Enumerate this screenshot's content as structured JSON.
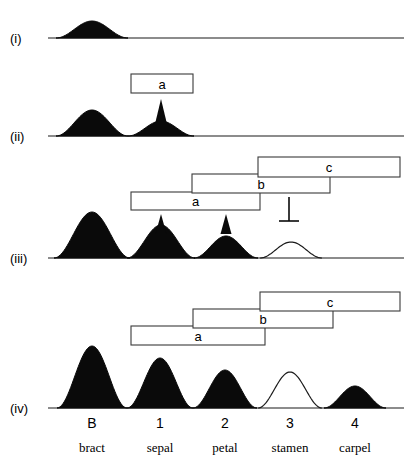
{
  "figure": {
    "width": 418,
    "height": 468,
    "background": "#ffffff",
    "ink_color": "#0a0a0a",
    "box_stroke": "#3a3a3a"
  },
  "panels": [
    {
      "id": "i",
      "label": "(i)",
      "label_x": 10,
      "label_y": 38,
      "baseline_y": 38,
      "baseline_x0": 48,
      "baseline_x1": 404,
      "boxes": [],
      "arrows": [],
      "inhibitors": [],
      "curves": [
        {
          "name": "bract-domain",
          "center": 92,
          "halfwidth": 36,
          "height": 17,
          "filled": true
        }
      ]
    },
    {
      "id": "ii",
      "label": "(ii)",
      "label_x": 10,
      "label_y": 136,
      "baseline_y": 136,
      "baseline_x0": 48,
      "baseline_x1": 404,
      "boxes": [
        {
          "label": "a",
          "x0": 131,
          "x1": 193,
          "y0": 74,
          "y1": 93
        }
      ],
      "arrows": [
        {
          "name": "arrow-a-to-sepal",
          "x": 161,
          "y_tip": 99,
          "y_base": 122
        }
      ],
      "inhibitors": [],
      "curves": [
        {
          "name": "bract-domain",
          "center": 92,
          "halfwidth": 36,
          "height": 26,
          "filled": true
        },
        {
          "name": "sepal-domain",
          "center": 161,
          "halfwidth": 33,
          "height": 15,
          "filled": true
        }
      ]
    },
    {
      "id": "iii",
      "label": "(iii)",
      "label_x": 10,
      "label_y": 258,
      "baseline_y": 258,
      "baseline_x0": 48,
      "baseline_x1": 404,
      "boxes": [
        {
          "label": "c",
          "x0": 258,
          "x1": 400,
          "y0": 157,
          "y1": 177
        },
        {
          "label": "b",
          "x0": 192,
          "x1": 330,
          "y0": 174,
          "y1": 193
        },
        {
          "label": "a",
          "x0": 131,
          "x1": 260,
          "y0": 192,
          "y1": 210
        }
      ],
      "arrows": [
        {
          "name": "arrow-a-to-sepal",
          "x": 161,
          "y_tip": 214,
          "y_base": 234
        },
        {
          "name": "arrow-a-to-petal",
          "x": 226,
          "y_tip": 214,
          "y_base": 234
        }
      ],
      "inhibitors": [
        {
          "name": "inhibit-c-on-a",
          "x": 289,
          "y_top": 197,
          "y_bottom": 221,
          "bar_halfwidth": 10
        }
      ],
      "curves": [
        {
          "name": "bract-domain",
          "center": 92,
          "halfwidth": 38,
          "height": 46,
          "filled": true
        },
        {
          "name": "sepal-domain",
          "center": 161,
          "halfwidth": 34,
          "height": 33,
          "filled": true
        },
        {
          "name": "petal-domain",
          "center": 226,
          "halfwidth": 32,
          "height": 22,
          "filled": true
        },
        {
          "name": "stamen-domain",
          "center": 291,
          "halfwidth": 31,
          "height": 16,
          "filled": false
        }
      ]
    },
    {
      "id": "iv",
      "label": "(iv)",
      "label_x": 10,
      "label_y": 408,
      "baseline_y": 408,
      "baseline_x0": 48,
      "baseline_x1": 404,
      "boxes": [
        {
          "label": "c",
          "x0": 260,
          "x1": 400,
          "y0": 292,
          "y1": 311
        },
        {
          "label": "b",
          "x0": 193,
          "x1": 333,
          "y0": 309,
          "y1": 328
        },
        {
          "label": "a",
          "x0": 131,
          "x1": 265,
          "y0": 326,
          "y1": 345
        }
      ],
      "arrows": [],
      "inhibitors": [],
      "curves": [
        {
          "name": "bract-domain",
          "center": 92,
          "halfwidth": 35,
          "height": 62,
          "filled": true
        },
        {
          "name": "sepal-domain",
          "center": 160,
          "halfwidth": 33,
          "height": 50,
          "filled": true
        },
        {
          "name": "petal-domain",
          "center": 225,
          "halfwidth": 32,
          "height": 38,
          "filled": true
        },
        {
          "name": "stamen-domain",
          "center": 290,
          "halfwidth": 32,
          "height": 36,
          "filled": false
        },
        {
          "name": "carpel-domain",
          "center": 355,
          "halfwidth": 31,
          "height": 22,
          "filled": true
        }
      ]
    }
  ],
  "axis": {
    "numbers_y": 428,
    "names_y": 452,
    "ticks": [
      {
        "number": "B",
        "name": "bract",
        "x": 92
      },
      {
        "number": "1",
        "name": "sepal",
        "x": 160
      },
      {
        "number": "2",
        "name": "petal",
        "x": 225
      },
      {
        "number": "3",
        "name": "stamen",
        "x": 290
      },
      {
        "number": "4",
        "name": "carpel",
        "x": 355
      }
    ]
  }
}
